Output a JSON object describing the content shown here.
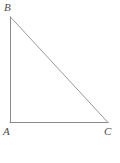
{
  "figure": {
    "type": "right-triangle-diagram",
    "stroke_color": "#8a8a8a",
    "label_color": "#4a4a4a",
    "background_color": "#ffffff",
    "vertices": {
      "B": {
        "label": "B",
        "x": 10,
        "y": 17
      },
      "A": {
        "label": "A",
        "x": 10,
        "y": 122
      },
      "C": {
        "label": "C",
        "x": 108,
        "y": 122
      }
    },
    "sides": [
      {
        "name": "AB",
        "from": "A",
        "to": "B",
        "orientation": "vertical"
      },
      {
        "name": "AC",
        "from": "A",
        "to": "C",
        "orientation": "horizontal"
      },
      {
        "name": "BC",
        "from": "B",
        "to": "C",
        "orientation": "hypotenuse"
      }
    ],
    "right_angle_at": "A"
  },
  "annotation": {
    "scribble_text": "YL",
    "scribble_name": "handwritten-scribble",
    "circle_name": "hand-drawn-circle",
    "ink_color": "#555555"
  },
  "answer": {
    "choice_letter": "C.",
    "measure": "16 m",
    "value": 16,
    "unit": "m"
  }
}
